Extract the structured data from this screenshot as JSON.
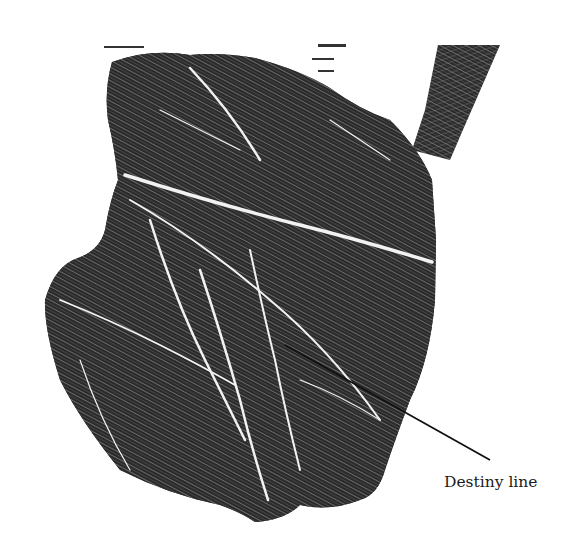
{
  "figure": {
    "annotation": {
      "label": "Destiny line",
      "pointer_from": [
        285,
        345
      ],
      "pointer_to": [
        490,
        460
      ]
    },
    "colors": {
      "background": "#ffffff",
      "ink": "#1c1c1c",
      "crease": "#f2f2f2",
      "pointer": "#111111"
    }
  }
}
